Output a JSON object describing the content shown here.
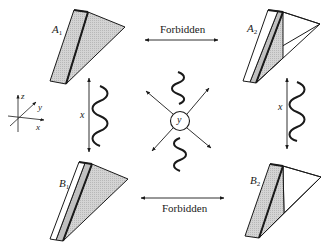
{
  "diagram": {
    "type": "crystal-twin-transition-scheme",
    "colors": {
      "stroke": "#1a1a1a",
      "wedge_fill": "#c8c8c8",
      "wedge_fill_light": "#d9d9d9",
      "white": "#ffffff"
    },
    "wedges": [
      {
        "id": "A1",
        "label": "A",
        "subscript": "1",
        "position": "top-left"
      },
      {
        "id": "A2",
        "label": "A",
        "subscript": "2",
        "position": "top-right"
      },
      {
        "id": "B1",
        "label": "B",
        "subscript": "1",
        "position": "bottom-left"
      },
      {
        "id": "B2",
        "label": "B",
        "subscript": "2",
        "position": "bottom-right"
      }
    ],
    "transitions": {
      "top": {
        "label": "Forbidden",
        "between": [
          "A1",
          "A2"
        ]
      },
      "bottom": {
        "label": "Forbidden",
        "between": [
          "B1",
          "B2"
        ]
      },
      "left": {
        "label": "x",
        "between": [
          "A1",
          "B1"
        ],
        "has_wave": true
      },
      "right": {
        "label": "x",
        "between": [
          "A2",
          "B2"
        ],
        "has_wave": true
      }
    },
    "center": {
      "label": "y",
      "shape": "circle",
      "arrows": [
        "up-left",
        "up-right",
        "down-left",
        "down-right"
      ],
      "waves": [
        "above",
        "below"
      ]
    },
    "axes": {
      "x": "x",
      "y": "y",
      "z": "z"
    }
  }
}
